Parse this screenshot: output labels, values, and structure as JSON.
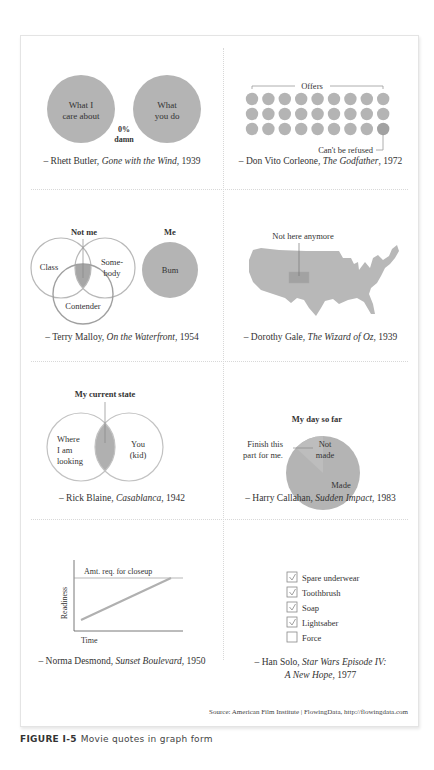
{
  "figure": {
    "label": "FIGURE I-5",
    "title": "Movie quotes in graph form",
    "source": "Source: American Film Institute  |  FlowingData, http://flowingdata.com"
  },
  "colors": {
    "fill": "#b4b4b4",
    "fill_dark": "#a2a2a2",
    "fill_light": "#c8c8c8",
    "stroke": "#a8a8a8",
    "text": "#333333"
  },
  "panels": [
    {
      "id": "rhett",
      "left_circle": "What I|care about",
      "right_circle": "What|you do",
      "overlap_value": "0%",
      "overlap_label": "damn",
      "quote_name": "– Rhett Butler, ",
      "quote_film": "Gone with the Wind",
      "quote_year": ", 1939"
    },
    {
      "id": "corleone",
      "bracket_label": "Offers",
      "rows": 3,
      "cols": 9,
      "annotation": "Can't be refused",
      "quote_name": "– Don Vito Corleone, ",
      "quote_film": "The Godfather",
      "quote_year": ", 1972"
    },
    {
      "id": "malloy",
      "title_left": "Not me",
      "title_right": "Me",
      "circle_a": "Class",
      "circle_b": "Some-|body",
      "circle_c": "Contender",
      "me_circle": "Bum",
      "quote_name": "– Terry Malloy, ",
      "quote_film": "On the Waterfront",
      "quote_year": ", 1954"
    },
    {
      "id": "dorothy",
      "annotation": "Not here anymore",
      "quote_name": "– Dorothy Gale, ",
      "quote_film": "The Wizard of Oz",
      "quote_year": ", 1939"
    },
    {
      "id": "rick",
      "title": "My current state",
      "left_circle": "Where|I am|looking",
      "right_circle": "You|(kid)",
      "quote_name": "– Rick Blaine, ",
      "quote_film": "Casablanca",
      "quote_year": ", 1942"
    },
    {
      "id": "harry",
      "title": "My day so far",
      "annotation": "Finish this|part for me.",
      "slice_small": "Not|made",
      "slice_large": "Made",
      "quote_name": "– Harry Callahan, ",
      "quote_film": "Sudden Impact",
      "quote_year": ", 1983"
    },
    {
      "id": "norma",
      "line_label": "Amt. req. for closeup",
      "ylabel": "Readiness",
      "xlabel": "Time",
      "quote_name": "– Norma Desmond, ",
      "quote_film": "Sunset Boulevard",
      "quote_year": ", 1950"
    },
    {
      "id": "han",
      "checklist": [
        {
          "label": "Spare underwear",
          "checked": true
        },
        {
          "label": "Toothbrush",
          "checked": true
        },
        {
          "label": "Soap",
          "checked": true
        },
        {
          "label": "Lightsaber",
          "checked": true
        },
        {
          "label": "Force",
          "checked": false
        }
      ],
      "quote_name": "– Han Solo, ",
      "quote_film": "Star Wars Episode IV:",
      "quote_film2": "A New Hope",
      "quote_year": ", 1977"
    }
  ],
  "chart_data": [
    {
      "type": "venn",
      "title": "",
      "sets": [
        "What I care about",
        "What you do"
      ],
      "overlap": "0% damn",
      "annotation": "– Rhett Butler, Gone with the Wind, 1939"
    },
    {
      "type": "unit",
      "title": "Offers",
      "count": 27,
      "grid": [
        3,
        9
      ],
      "highlighted": {
        "index": 26,
        "label": "Can't be refused"
      },
      "annotation": "– Don Vito Corleone, The Godfather, 1972"
    },
    {
      "type": "venn",
      "title": "Not me / Me",
      "sets": [
        "Class",
        "Somebody",
        "Contender"
      ],
      "intersection_label": "Not me",
      "separate_set": "Bum",
      "separate_label": "Me",
      "annotation": "– Terry Malloy, On the Waterfront, 1954"
    },
    {
      "type": "map",
      "region": "United States",
      "highlighted": "Kansas",
      "label": "Not here anymore",
      "annotation": "– Dorothy Gale, The Wizard of Oz, 1939"
    },
    {
      "type": "venn",
      "title": "My current state",
      "sets": [
        "Where I am looking",
        "You (kid)"
      ],
      "intersection_label": "My current state",
      "annotation": "– Rick Blaine, Casablanca, 1942"
    },
    {
      "type": "pie",
      "title": "My day so far",
      "categories": [
        "Not made",
        "Made"
      ],
      "values": [
        12,
        88
      ],
      "callout": "Finish this part for me.",
      "annotation": "– Harry Callahan, Sudden Impact, 1983"
    },
    {
      "type": "line",
      "title": "",
      "xlabel": "Time",
      "ylabel": "Readiness",
      "x": [
        0,
        1
      ],
      "series": [
        {
          "name": "Readiness",
          "values": [
            0.1,
            1.0
          ]
        }
      ],
      "reference_line": {
        "label": "Amt. req. for closeup",
        "value": 1.0
      },
      "grid": false,
      "annotation": "– Norma Desmond, Sunset Boulevard, 1950"
    },
    {
      "type": "table",
      "title": "Checklist",
      "rows": [
        [
          "Spare underwear",
          true
        ],
        [
          "Toothbrush",
          true
        ],
        [
          "Soap",
          true
        ],
        [
          "Lightsaber",
          true
        ],
        [
          "Force",
          false
        ]
      ],
      "annotation": "– Han Solo, Star Wars Episode IV: A New Hope, 1977"
    }
  ]
}
